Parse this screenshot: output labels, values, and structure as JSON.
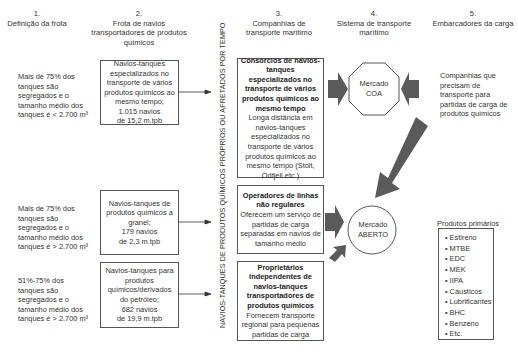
{
  "headers": [
    {
      "num": "1.",
      "title": "Definição da frota"
    },
    {
      "num": "2.",
      "title": "Frota de navios transportadores de produtos químicos"
    },
    {
      "num": "3.",
      "title": "Companhias de transporte marítimo"
    },
    {
      "num": "4.",
      "title": "Sistema de transporte marítimo"
    },
    {
      "num": "5.",
      "title": "Embarcadores da carga"
    }
  ],
  "fleet_definitions": [
    "Mais de 75% dos tanques são segregados e o tamanho médio dos tanques é < 2.700 m³",
    "Mais de 75% dos tanques são segregados e o tamanho médio dos tanques é > 2.700 m³",
    "51%-75% dos tanques são segregados e o tamanho médio dos tanques é > 2.700 m³"
  ],
  "fleets": [
    {
      "text": "Navios-tanques especializados no transporte de vários produtos químicos ao mesmo tempo;",
      "count": "1.015 navios",
      "tonnage": "de 15,2 m.tpb"
    },
    {
      "text": "Navios-tanques de produtos químicos a granel;",
      "count": "179 navios",
      "tonnage": "de 2,3 m.tpb"
    },
    {
      "text": "Navios-tanques para produtos químicos/derivados do petróleo;",
      "count": "682 navios",
      "tonnage": "de 19,9 m.tpb"
    }
  ],
  "vertical_label": "NAVIOS-TANQUES DE PRODUTOS QUÍMICOS PRÓPRIOS OU AFRETADOS POR TEMPO",
  "companies": [
    {
      "title": "Consórcios de navios-tanques especializados no transporte de vários produtos químicos ao mesmo tempo",
      "desc": "Longa distância em navios-tanques especializados no transporte de vários produtos químicos ao mesmo tempo (Stolt, Odfjell etc.)"
    },
    {
      "title": "Operadores de linhas não regulares",
      "desc": "Oferecem um serviço de partidas de carga separadas em navios de tamanho médio"
    },
    {
      "title": "Proprietários independentes de navios-tanques transportadores de produtos químicos",
      "desc": "Fornecem transporte regional para pequenas partidas de carga"
    }
  ],
  "markets": [
    {
      "line1": "Mercado",
      "line2": "COA",
      "shape": "octagon"
    },
    {
      "line1": "Mercado",
      "line2": "ABERTO",
      "shape": "circle"
    }
  ],
  "shippers": {
    "description": "Companhias que precisam de transporte para partidas de carga de produtos químicos",
    "products_title": "Produtos primários",
    "products": [
      "Estireno",
      "MTBE",
      "EDC",
      "MEK",
      "IIPA",
      "Cáusticos",
      "Lubrificantes",
      "BHC",
      "Benzeno",
      "Etc."
    ]
  },
  "colors": {
    "arrow_fill": "#5a5a5a",
    "border": "#555555",
    "text": "#333333"
  }
}
